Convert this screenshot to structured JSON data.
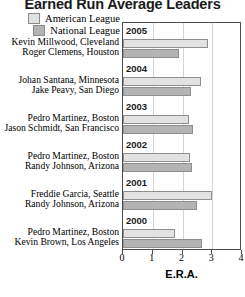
{
  "title": "Earned Run Average Leaders",
  "legend": {
    "position": "top-left",
    "items": [
      {
        "label": "American League",
        "color": "#e2e2e2",
        "key": "al"
      },
      {
        "label": "National League",
        "color": "#b4b4b4",
        "key": "nl"
      }
    ]
  },
  "axis": {
    "xlabel": "E.R.A.",
    "ticks": [
      "0",
      "1",
      "2",
      "3",
      "4"
    ],
    "xlim": [
      0,
      4
    ]
  },
  "chart_data": {
    "type": "bar",
    "orientation": "horizontal",
    "title": "Earned Run Average Leaders",
    "xlabel": "E.R.A.",
    "ylabel": "",
    "xlim": [
      0,
      4
    ],
    "grid": true,
    "legend_position": "top-left",
    "categories": [
      "2005",
      "2004",
      "2003",
      "2002",
      "2001",
      "2000"
    ],
    "series": [
      {
        "name": "American League",
        "color": "#e2e2e2",
        "values": [
          2.86,
          2.61,
          2.22,
          2.26,
          2.99,
          1.74
        ],
        "players": [
          "Kevin Millwood, Cleveland",
          "Johan Santana, Minnesota",
          "Pedro Martinez, Boston",
          "Pedro Martinez, Boston",
          "Freddie Garcia, Seattle",
          "Pedro Martinez, Boston"
        ]
      },
      {
        "name": "National League",
        "color": "#b4b4b4",
        "values": [
          1.87,
          2.27,
          2.34,
          2.32,
          2.49,
          2.64
        ],
        "players": [
          "Roger Clemens, Houston",
          "Jake Peavy, San Diego",
          "Jason Schmidt, San Francisco",
          "Randy Johnson, Arizona",
          "Randy Johnson, Arizona",
          "Kevin Brown, Los Angeles"
        ]
      }
    ],
    "groups": [
      {
        "year": "2005",
        "al_player": "Kevin Millwood, Cleveland",
        "al_era": 2.86,
        "nl_player": "Roger Clemens, Houston",
        "nl_era": 1.87
      },
      {
        "year": "2004",
        "al_player": "Johan Santana, Minnesota",
        "al_era": 2.61,
        "nl_player": "Jake Peavy, San Diego",
        "nl_era": 2.27
      },
      {
        "year": "2003",
        "al_player": "Pedro Martinez, Boston",
        "al_era": 2.22,
        "nl_player": "Jason Schmidt, San Francisco",
        "nl_era": 2.34
      },
      {
        "year": "2002",
        "al_player": "Pedro Martinez, Boston",
        "al_era": 2.26,
        "nl_player": "Randy Johnson, Arizona",
        "nl_era": 2.32
      },
      {
        "year": "2001",
        "al_player": "Freddie Garcia, Seattle",
        "al_era": 2.99,
        "nl_player": "Randy Johnson, Arizona",
        "nl_era": 2.49
      },
      {
        "year": "2000",
        "al_player": "Pedro Martinez, Boston",
        "al_era": 1.74,
        "nl_player": "Kevin Brown, Los Angeles",
        "nl_era": 2.64
      }
    ]
  }
}
